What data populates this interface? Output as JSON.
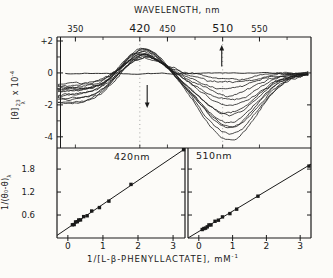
{
  "meta": {
    "bg": "#fcfbf8",
    "ink": "#1a1a1a",
    "grid_dot_color": "#999999"
  },
  "labels": {
    "top_title": "WAVELENGTH, nm",
    "top_ylabel": {
      "bracket": "[θ]",
      "sup": "23",
      "sub": "λ",
      "mult": " x 10",
      "exp": "-4"
    },
    "bottom_ylabel": {
      "main": "1/(θ₀-θ)",
      "sub": "λ"
    },
    "bottom_xlabel": {
      "main": "1/[L-β-PHENYLLACTATE], mM",
      "exp": "-1"
    }
  },
  "chart_data": [
    {
      "id": "cd-spectra",
      "type": "line",
      "title": "WAVELENGTH, nm",
      "ylabel": "[θ]λ^23 x 10^-4",
      "x_unit": "nm",
      "x_range": [
        330,
        606
      ],
      "y_range": [
        -4.7,
        2.25
      ],
      "x_ticks": [
        {
          "v": 350,
          "label": "350",
          "big": false
        },
        {
          "v": 420,
          "label": "420",
          "big": true
        },
        {
          "v": 450,
          "label": "450",
          "big": false
        },
        {
          "v": 510,
          "label": "510",
          "big": true
        },
        {
          "v": 550,
          "label": "550",
          "big": false
        }
      ],
      "x_minor_ticks": [
        380,
        480,
        580
      ],
      "y_ticks": [
        {
          "v": 2,
          "label": "+2"
        },
        {
          "v": 0,
          "label": "0"
        },
        {
          "v": -2,
          "label": "-2"
        },
        {
          "v": -4,
          "label": "-4"
        }
      ],
      "y_minor_ticks": [
        1,
        -1,
        -3
      ],
      "right_ticks": [
        0,
        -2,
        -4
      ],
      "dotted_gridlines": [
        420,
        510
      ],
      "arrows": [
        {
          "x": 428,
          "from": -0.75,
          "to": -2.2,
          "dir": "down"
        },
        {
          "x": 509,
          "from": 0.4,
          "to": 1.75,
          "dir": "up"
        }
      ],
      "baseline": {
        "value": -0.05
      },
      "curve_shape": {
        "start": 331,
        "end": 604,
        "step_center": 392,
        "step_width": 14,
        "peak_center": 423,
        "peak_width": 30,
        "trough_center": 517,
        "trough_width": 43
      },
      "curves": [
        {
          "left": -0.7,
          "peak_420": 1.0,
          "trough_510": -0.35
        },
        {
          "left": -1.0,
          "peak_420": 1.06,
          "trough_510": -0.7
        },
        {
          "left": -1.4,
          "peak_420": 1.12,
          "trough_510": -1.05
        },
        {
          "left": -0.8,
          "peak_420": 1.18,
          "trough_510": -1.4
        },
        {
          "left": -1.7,
          "peak_420": 1.24,
          "trough_510": -1.72
        },
        {
          "left": -1.1,
          "peak_420": 1.3,
          "trough_510": -2.04
        },
        {
          "left": -1.9,
          "peak_420": 1.36,
          "trough_510": -2.36
        },
        {
          "left": -0.9,
          "peak_420": 1.42,
          "trough_510": -2.66
        },
        {
          "left": -1.5,
          "peak_420": 1.48,
          "trough_510": -2.96
        },
        {
          "left": -1.2,
          "peak_420": 1.54,
          "trough_510": -3.26
        },
        {
          "left": -1.8,
          "peak_420": 1.6,
          "trough_510": -3.55
        },
        {
          "left": -1.0,
          "peak_420": 1.66,
          "trough_510": -3.85
        },
        {
          "left": -1.6,
          "peak_420": 1.7,
          "trough_510": -4.15
        }
      ]
    },
    {
      "id": "double-reciprocal-420",
      "type": "scatter",
      "label": "420nm",
      "line": {
        "slope": 0.62,
        "intercept": 0.26
      },
      "points_x": [
        0.13,
        0.18,
        0.22,
        0.27,
        0.31,
        0.36,
        0.45,
        0.55,
        0.68,
        0.9,
        1.17,
        1.8,
        3.3
      ],
      "x_ticks": [
        0,
        1,
        2,
        3
      ],
      "y_ticks": [
        0.6,
        1.2,
        1.8
      ],
      "x_range": [
        -0.31,
        3.34
      ],
      "y_range": [
        0,
        2.35
      ]
    },
    {
      "id": "double-reciprocal-510",
      "type": "scatter",
      "label": "510nm",
      "line": {
        "slope": 0.53,
        "intercept": 0.17
      },
      "points_x": [
        0.1,
        0.15,
        0.2,
        0.25,
        0.3,
        0.36,
        0.48,
        0.58,
        0.7,
        0.92,
        1.12,
        1.75,
        3.26
      ],
      "x_ticks": [
        0,
        1,
        2,
        3
      ],
      "y_ticks": [
        0.6,
        1.2,
        1.8
      ],
      "x_range": [
        -0.32,
        3.32
      ],
      "y_range": [
        0,
        2.35
      ]
    }
  ]
}
